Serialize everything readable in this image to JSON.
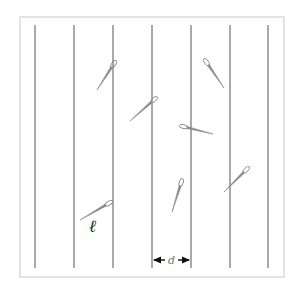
{
  "diagram": {
    "type": "buffon-needle",
    "frame": {
      "x": 20,
      "y": 17,
      "width": 264,
      "height": 260,
      "stroke": "#c8c8c8"
    },
    "lines": {
      "x_positions": [
        35,
        74,
        113,
        152,
        191,
        230,
        268
      ],
      "y_top": 25,
      "y_bottom": 268,
      "stroke": "#555555"
    },
    "needles": [
      {
        "eye": [
          115,
          62
        ],
        "tip": [
          97,
          90
        ]
      },
      {
        "eye": [
          156,
          98
        ],
        "tip": [
          130,
          121
        ]
      },
      {
        "eye": [
          181,
          126
        ],
        "tip": [
          213,
          134
        ]
      },
      {
        "eye": [
          205,
          60
        ],
        "tip": [
          224,
          88
        ]
      },
      {
        "eye": [
          182,
          180
        ],
        "tip": [
          172,
          212
        ]
      },
      {
        "eye": [
          248,
          168
        ],
        "tip": [
          224,
          192
        ]
      },
      {
        "eye": [
          111,
          202
        ],
        "tip": [
          80,
          220
        ]
      }
    ],
    "needle_color": "#8a8a8a",
    "labels": {
      "needle_length": "ℓ",
      "line_spacing": "d"
    },
    "spacing_arrow": {
      "x1": 152,
      "x2": 191,
      "y": 260
    }
  }
}
